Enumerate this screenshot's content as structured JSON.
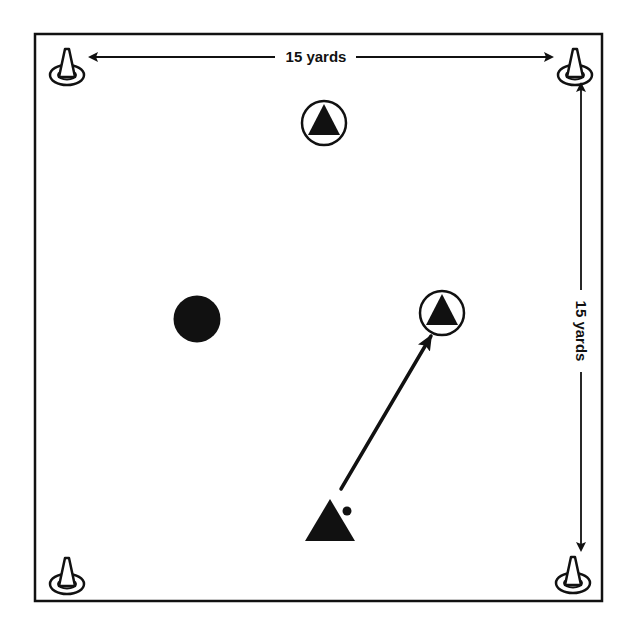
{
  "diagram": {
    "type": "soccer drill field diagram",
    "field": {
      "shape": "square",
      "width_label": "15 yards",
      "height_label": "15 yards",
      "border_color": "#111111",
      "background": "#ffffff"
    },
    "dimensions": {
      "top": {
        "label": "15 yards",
        "orientation": "horizontal"
      },
      "right": {
        "label": "15 yards",
        "orientation": "vertical"
      }
    },
    "cones": [
      {
        "id": "cone-top-left",
        "position": "top-left"
      },
      {
        "id": "cone-top-right",
        "position": "top-right"
      },
      {
        "id": "cone-bottom-left",
        "position": "bottom-left"
      },
      {
        "id": "cone-bottom-right",
        "position": "bottom-right"
      }
    ],
    "players": [
      {
        "id": "player-circled-top",
        "symbol": "triangle-in-circle",
        "role": "circled attacker (top)"
      },
      {
        "id": "player-circled-right",
        "symbol": "triangle-in-circle",
        "role": "circled attacker (target of pass)"
      },
      {
        "id": "player-with-ball",
        "symbol": "triangle",
        "role": "attacker with ball"
      },
      {
        "id": "defender",
        "symbol": "filled-circle",
        "role": "defender"
      }
    ],
    "ball": {
      "id": "ball",
      "owner": "player-with-ball"
    },
    "arrows": [
      {
        "id": "pass-arrow",
        "from": "player-with-ball",
        "to": "player-circled-right",
        "meaning": "pass"
      }
    ],
    "colors": {
      "ink": "#111111",
      "paper": "#ffffff"
    }
  }
}
